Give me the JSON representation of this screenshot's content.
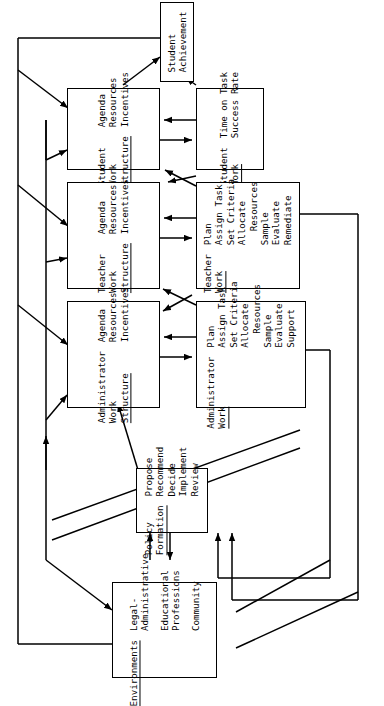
{
  "diagram": {
    "orientation": "rotated-90-clockwise",
    "background_color": "#ffffff",
    "line_color": "#000000"
  },
  "boxes": [
    {
      "id": "student-achievement",
      "name": "student-achievement-box",
      "header": [
        "Student",
        "Achievement"
      ],
      "header_underline": false,
      "items": []
    },
    {
      "id": "student-work-structure",
      "name": "student-work-structure-box",
      "header": [
        "Student",
        "Work",
        "Structure"
      ],
      "header_underline": true,
      "items": [
        "Agenda",
        "Resources",
        "Incentives"
      ]
    },
    {
      "id": "student-work",
      "name": "student-work-box",
      "header": [
        "Student",
        "Work"
      ],
      "header_underline": true,
      "items": [
        "Time on Task",
        "Success Rate"
      ]
    },
    {
      "id": "teacher-work-structure",
      "name": "teacher-work-structure-box",
      "header": [
        "Teacher",
        "Work",
        "Structure"
      ],
      "header_underline": true,
      "items": [
        "Agenda",
        "Resources",
        "Incentives"
      ]
    },
    {
      "id": "teacher-work",
      "name": "teacher-work-box",
      "header": [
        "Teacher",
        "Work"
      ],
      "header_underline": true,
      "items": [
        "Plan",
        "Assign Task",
        "Set Criteria",
        "Allocate",
        "Resources",
        "Sample",
        "Evaluate",
        "Remediate"
      ]
    },
    {
      "id": "administrator-work-structure",
      "name": "administrator-work-structure-box",
      "header": [
        "Administrator",
        "Work",
        "Structure"
      ],
      "header_underline": true,
      "items": [
        "Agenda",
        "Resources",
        "Incentives"
      ]
    },
    {
      "id": "administrator-work",
      "name": "administrator-work-box",
      "header": [
        "Administrator",
        "Work"
      ],
      "header_underline": true,
      "items": [
        "Plan",
        "Assign Task",
        "Set Criteria",
        "Allocate",
        "Resources",
        "Sample",
        "Evaluate",
        "Support"
      ]
    },
    {
      "id": "policy-formation",
      "name": "policy-formation-box",
      "header": [
        "Policy",
        "Formation"
      ],
      "header_underline": true,
      "items": [
        "Propose",
        "Recommend",
        "Decide",
        "Implement",
        "Review"
      ]
    },
    {
      "id": "environments",
      "name": "environments-box",
      "header": [
        "Environments"
      ],
      "header_underline": true,
      "items": [
        "Legal-",
        "Administrative",
        "Educational",
        "Professions",
        "Community"
      ]
    }
  ]
}
